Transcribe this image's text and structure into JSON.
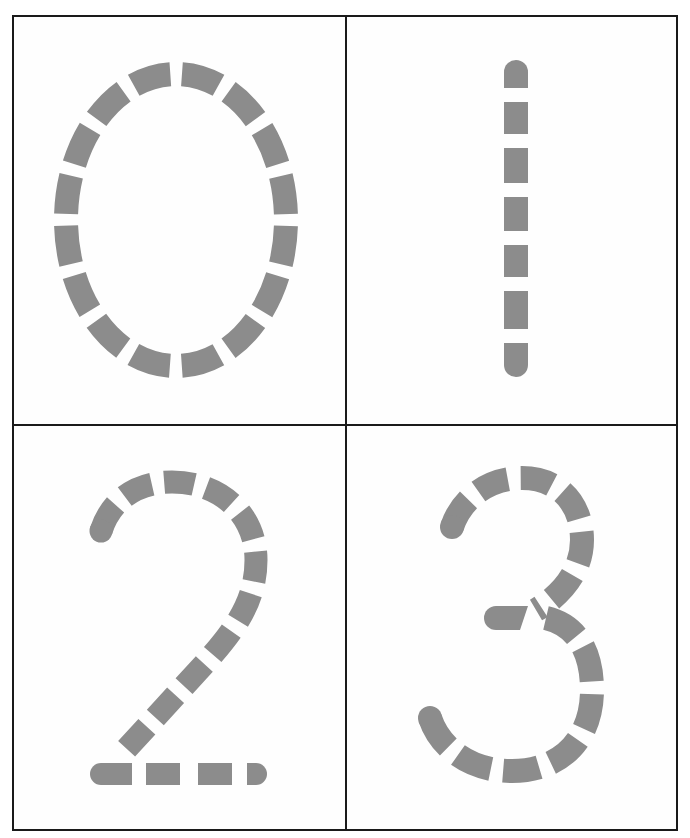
{
  "worksheet": {
    "title": "Number tracing cards 0–3",
    "stroke_color": "#8c8c8c",
    "border_color": "#1a1a1a",
    "cards": [
      {
        "digit": "0",
        "segments": 16
      },
      {
        "digit": "1",
        "segments": 7
      },
      {
        "digit": "2",
        "segments": 16
      },
      {
        "digit": "3",
        "segments": 17
      }
    ]
  }
}
